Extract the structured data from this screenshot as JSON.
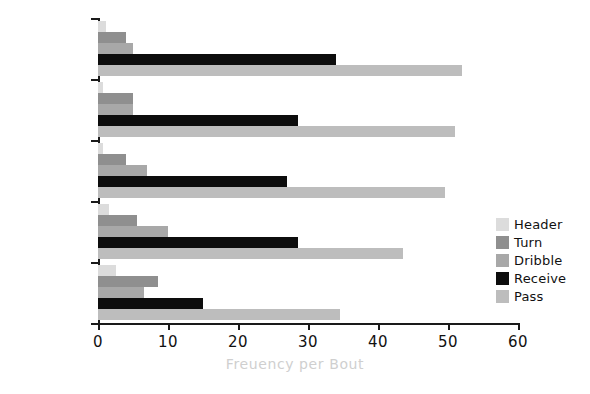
{
  "chart_data": {
    "type": "bar",
    "orientation": "horizontal",
    "title": "",
    "xlabel": "Freuency per Bout",
    "ylabel": "Format",
    "categories": [
      "5v5",
      "4v4",
      "3v3",
      "2v2",
      "1v1"
    ],
    "xlim": [
      0,
      60
    ],
    "xticks": [
      0,
      10,
      20,
      30,
      40,
      50,
      60
    ],
    "xticklabels": [
      "0",
      "10",
      "20",
      "30",
      "40",
      "50",
      "60"
    ],
    "grid": false,
    "legend_position": "center right",
    "series": [
      {
        "name": "Header",
        "color": "#dcdcdc",
        "values": [
          1.2,
          0.7,
          0.7,
          1.5,
          2.5
        ]
      },
      {
        "name": "Turn",
        "color": "#8f8f8f",
        "values": [
          4.0,
          5.0,
          4.0,
          5.5,
          8.5
        ]
      },
      {
        "name": "Dribble",
        "color": "#a8a8a8",
        "values": [
          5.0,
          5.0,
          7.0,
          10.0,
          6.5
        ]
      },
      {
        "name": "Receive",
        "color": "#0d0d0d",
        "values": [
          34.0,
          28.5,
          27.0,
          28.5,
          15.0
        ]
      },
      {
        "name": "Pass",
        "color": "#bdbdbd",
        "values": [
          52.0,
          51.0,
          49.5,
          43.5,
          34.5
        ]
      }
    ]
  },
  "legend": {
    "items": [
      {
        "label": "Header",
        "color": "#dcdcdc"
      },
      {
        "label": "Turn",
        "color": "#8f8f8f"
      },
      {
        "label": "Dribble",
        "color": "#a8a8a8"
      },
      {
        "label": "Receive",
        "color": "#0d0d0d"
      },
      {
        "label": "Pass",
        "color": "#bdbdbd"
      }
    ]
  },
  "axes": {
    "x_title": "Freuency per Bout",
    "y_title": "Format"
  }
}
